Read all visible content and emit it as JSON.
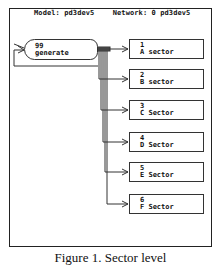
{
  "header": {
    "model": "Model: pd3dev5",
    "network": "Network: 0 pd3dev5"
  },
  "generate_node": {
    "number": "99",
    "label": "generate"
  },
  "sectors": [
    {
      "number": "1",
      "letter": "A",
      "label": "sector"
    },
    {
      "number": "2",
      "letter": "B",
      "label": "sector"
    },
    {
      "number": "3",
      "letter": "C",
      "label": "Sector"
    },
    {
      "number": "4",
      "letter": "D",
      "label": "Sector"
    },
    {
      "number": "5",
      "letter": "E",
      "label": "Sector"
    },
    {
      "number": "6",
      "letter": "F",
      "label": "Sector"
    }
  ],
  "caption": "Figure 1. Sector level"
}
